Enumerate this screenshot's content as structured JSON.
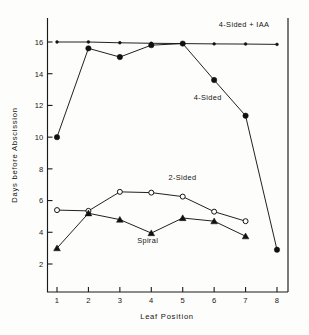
{
  "chart_data": {
    "type": "line",
    "title": "",
    "xlabel": "Leaf  Position",
    "ylabel": "Days before Abscission",
    "x": [
      1,
      2,
      3,
      4,
      5,
      6,
      7,
      8
    ],
    "xtick_labels": [
      "1",
      "2",
      "3",
      "4",
      "5",
      "6",
      "7",
      "8"
    ],
    "ytick_labels": [
      "2",
      "4",
      "6",
      "8",
      "10",
      "12",
      "14",
      "16"
    ],
    "ytick_values": [
      2,
      4,
      6,
      8,
      10,
      12,
      14,
      16
    ],
    "xlim": [
      0.6,
      8.4
    ],
    "ylim": [
      1.0,
      17.4
    ],
    "grid": false,
    "legend_position": "inline-annotations",
    "series": [
      {
        "name": "4-Sided + IAA",
        "marker": "small-filled-circle",
        "values": [
          16.0,
          16.0,
          15.95,
          15.92,
          15.9,
          15.88,
          15.87,
          15.85
        ]
      },
      {
        "name": "4-Sided",
        "marker": "filled-circle",
        "values": [
          10.0,
          15.6,
          15.05,
          15.8,
          15.9,
          13.6,
          11.35,
          2.9
        ]
      },
      {
        "name": "2-Sided",
        "marker": "open-circle",
        "values": [
          5.4,
          5.35,
          6.55,
          6.5,
          6.25,
          5.3,
          4.7,
          null
        ]
      },
      {
        "name": "Spiral",
        "marker": "filled-triangle",
        "values": [
          3.0,
          5.2,
          4.8,
          3.95,
          4.9,
          4.7,
          3.75,
          null
        ]
      }
    ],
    "annotations": [
      {
        "text": "4-Sided + IAA",
        "x": 6.15,
        "y": 16.95
      },
      {
        "text": "4-Sided",
        "x": 5.35,
        "y": 12.35
      },
      {
        "text": "2-Sided",
        "x": 4.55,
        "y": 7.3
      },
      {
        "text": "Spiral",
        "x": 3.55,
        "y": 3.35
      }
    ]
  }
}
